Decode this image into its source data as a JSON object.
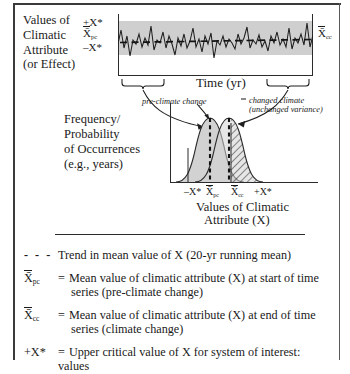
{
  "figure": {
    "top_panel": {
      "y_axis_block_label": [
        "Values of",
        "Climatic",
        "Attribute",
        "(or Effect)"
      ],
      "y_ticks": {
        "upper": "+X*",
        "mean": "X̄",
        "mean_sub": "pc",
        "lower": "–X*"
      },
      "right_marker": {
        "symbol": "X̄",
        "sub": "cc"
      },
      "x_axis_label": "Time (yr)"
    },
    "annotations": {
      "pre_climate_change": "pre-climate change",
      "changed_climate_line1": "changed climate",
      "changed_climate_line2": "(unchanged variance)"
    },
    "dist_panel": {
      "y_axis_block_label": [
        "Frequency/",
        "Probability",
        "of Occurrences",
        "(e.g., years)"
      ],
      "x_ticks": [
        {
          "label": "–X*",
          "sub": ""
        },
        {
          "label": "X̄",
          "sub": "pc"
        },
        {
          "label": "X̄",
          "sub": "cc"
        },
        {
          "label": "+X*",
          "sub": ""
        }
      ],
      "caption_line1": "Values of Climatic",
      "caption_line2": "Attribute (X)"
    },
    "legend": [
      {
        "key_glyph": "- - -",
        "key_type": "dashed-line",
        "key_sub": "",
        "eq": "",
        "text_line1": "Trend in mean value of X (20-yr running mean)",
        "text_line2": ""
      },
      {
        "key_glyph": "X̄",
        "key_type": "symbol",
        "key_sub": "pc",
        "eq": "=",
        "text_line1": "Mean value of climatic attribute (X) at start of time",
        "text_line2": "series (pre-climate change)"
      },
      {
        "key_glyph": "X̄",
        "key_type": "symbol",
        "key_sub": "cc",
        "eq": "=",
        "text_line1": "Mean value of climatic attribute (X) at end of time",
        "text_line2": "series (climate change)"
      },
      {
        "key_glyph": "+X*",
        "key_type": "symbol",
        "key_sub": "",
        "eq": "=",
        "text_line1": "Upper critical value of X for system of interest: values",
        "text_line2": ""
      }
    ],
    "colors": {
      "band_gray": "#cfcfcf",
      "curve_fill_gray": "#d0d0d0",
      "ink": "#1a1a1a",
      "rule": "#2b2b2b"
    }
  }
}
